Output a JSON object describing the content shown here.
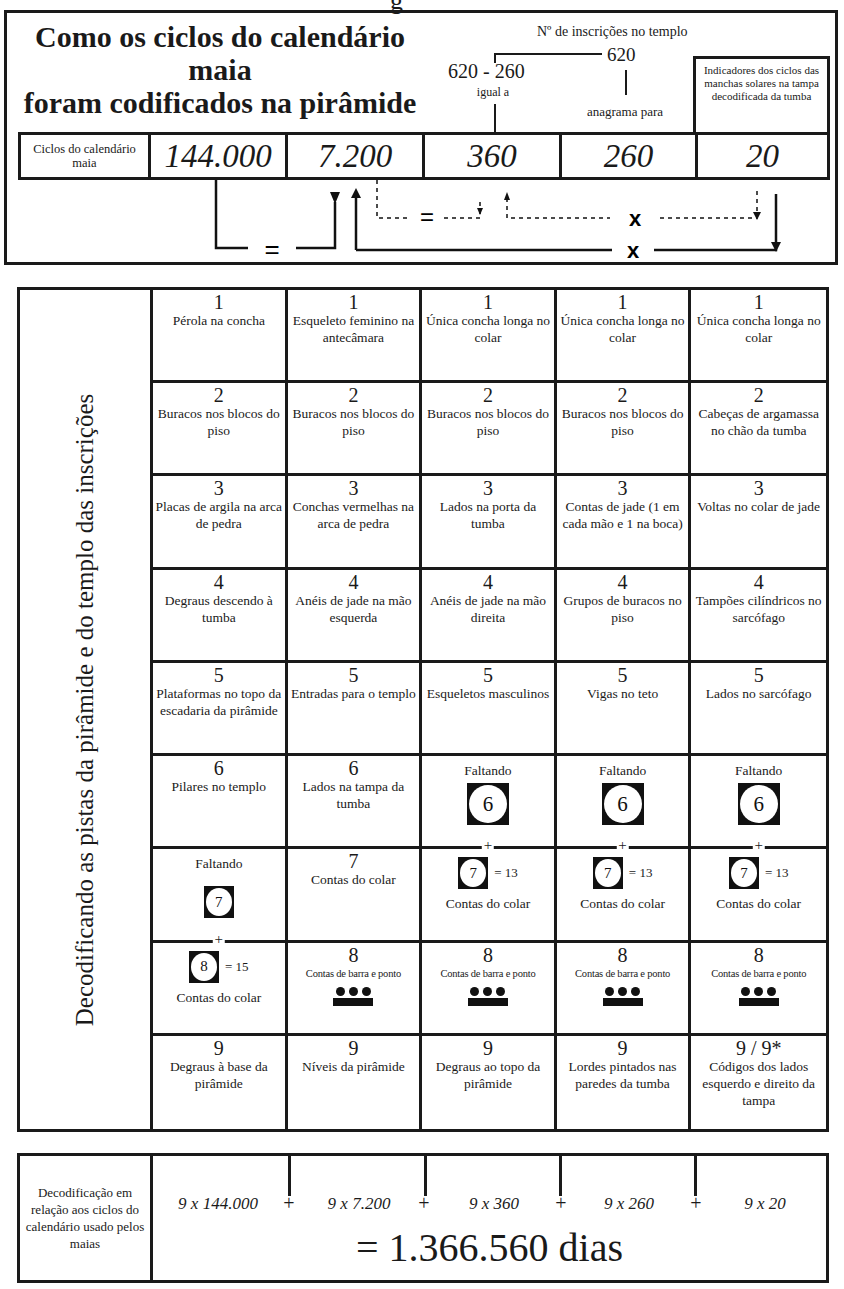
{
  "cut_heading_fragment": "g",
  "top": {
    "title_line1": "Como os ciclos do calendário maia",
    "title_line2": "foram codificados na pirâmide",
    "inscriptions_label": "Nº de inscrições no templo",
    "inscriptions_value": "620",
    "subtraction": "620 - 260",
    "equals_label": "igual a",
    "anagram_label": "anagrama para",
    "sunspot_label": "Indicadores dos ciclos das manchas solares na tampa decodificada da tumba",
    "cycles_label": "Ciclos do calendário maia",
    "cycles": [
      "144.000",
      "7.200",
      "360",
      "260",
      "20"
    ],
    "arrow_symbols": {
      "equals_outer": "=",
      "equals_inner": "=",
      "times_inner": "x",
      "times_outer": "x"
    }
  },
  "grid": {
    "side_label": "Decodificando as pistas da pirâmide e do templo das inscrições",
    "rows": [
      [
        {
          "num": "1",
          "desc": "Pérola na concha"
        },
        {
          "num": "1",
          "desc": "Esqueleto feminino na antecâmara"
        },
        {
          "num": "1",
          "desc": "Única concha longa no colar"
        },
        {
          "num": "1",
          "desc": "Única concha longa no colar"
        },
        {
          "num": "1",
          "desc": "Única concha longa no colar"
        }
      ],
      [
        {
          "num": "2",
          "desc": "Buracos nos blocos do piso"
        },
        {
          "num": "2",
          "desc": "Buracos nos blocos do piso"
        },
        {
          "num": "2",
          "desc": "Buracos nos blocos do piso"
        },
        {
          "num": "2",
          "desc": "Buracos nos blocos do piso"
        },
        {
          "num": "2",
          "desc": "Cabeças de argamassa no chão da tumba"
        }
      ],
      [
        {
          "num": "3",
          "desc": "Placas de argila na arca de pedra"
        },
        {
          "num": "3",
          "desc": "Conchas vermelhas na arca de pedra"
        },
        {
          "num": "3",
          "desc": "Lados na porta da tumba"
        },
        {
          "num": "3",
          "desc": "Contas de jade (1 em cada mão e 1 na boca)"
        },
        {
          "num": "3",
          "desc": "Voltas no colar de jade"
        }
      ],
      [
        {
          "num": "4",
          "desc": "Degraus descendo à tumba"
        },
        {
          "num": "4",
          "desc": "Anéis de jade na mão esquerda"
        },
        {
          "num": "4",
          "desc": "Anéis de jade na mão direita"
        },
        {
          "num": "4",
          "desc": "Grupos de buracos no piso"
        },
        {
          "num": "4",
          "desc": "Tampões cilíndricos no sarcófago"
        }
      ],
      [
        {
          "num": "5",
          "desc": "Plataformas no topo da escadaria da pirâmide"
        },
        {
          "num": "5",
          "desc": "Entradas para o templo"
        },
        {
          "num": "5",
          "desc": "Esqueletos masculinos"
        },
        {
          "num": "5",
          "desc": "Vigas no teto"
        },
        {
          "num": "5",
          "desc": "Lados no sarcófago"
        }
      ],
      [
        {
          "num": "6",
          "desc": "Pilares no templo"
        },
        {
          "num": "6",
          "desc": "Lados na tampa da tumba"
        },
        {
          "missing": "Faltando",
          "glyph": "6"
        },
        {
          "missing": "Faltando",
          "glyph": "6"
        },
        {
          "missing": "Faltando",
          "glyph": "6"
        }
      ],
      [
        {
          "missing": "Faltando",
          "glyph": "7"
        },
        {
          "num": "7",
          "desc": "Contas do colar"
        },
        {
          "plus": "+",
          "glyph": "7",
          "sum": "= 13",
          "desc": "Contas do colar"
        },
        {
          "plus": "+",
          "glyph": "7",
          "sum": "= 13",
          "desc": "Contas do colar"
        },
        {
          "plus": "+",
          "glyph": "7",
          "sum": "= 13",
          "desc": "Contas do colar"
        }
      ],
      [
        {
          "plus": "+",
          "glyph": "8",
          "sum": "= 15",
          "desc": "Contas do colar"
        },
        {
          "num": "8",
          "desc": "Contas de barra e ponto",
          "barpoint": true
        },
        {
          "num": "8",
          "desc": "Contas de barra e ponto",
          "barpoint": true
        },
        {
          "num": "8",
          "desc": "Contas de barra e ponto",
          "barpoint": true
        },
        {
          "num": "8",
          "desc": "Contas de barra e ponto",
          "barpoint": true
        }
      ],
      [
        {
          "num": "9",
          "desc": "Degraus à base da pirâmide"
        },
        {
          "num": "9",
          "desc": "Níveis da pirâmide"
        },
        {
          "num": "9",
          "desc": "Degraus ao topo da pirâmide"
        },
        {
          "num": "9",
          "desc": "Lordes pintados nas paredes da tumba"
        },
        {
          "num": "9 / 9*",
          "desc": "Códigos dos lados esquerdo e direito da tampa"
        }
      ]
    ]
  },
  "bottom": {
    "label": "Decodificação em relação aos ciclos do calendário usado pelos maias",
    "terms": [
      "9 x 144.000",
      "9 x 7.200",
      "9 x 360",
      "9 x 260",
      "9 x 20"
    ],
    "operator": "+",
    "total": "= 1.366.560 dias"
  }
}
